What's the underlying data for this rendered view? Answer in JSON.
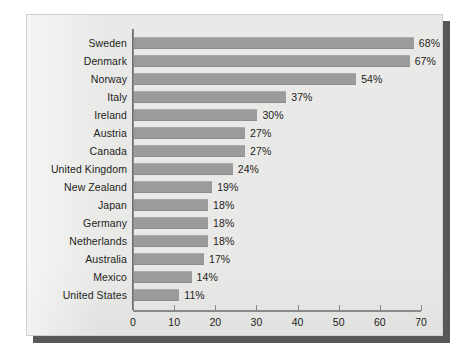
{
  "chart_data": {
    "type": "bar",
    "orientation": "horizontal",
    "title": "",
    "subtitle": "",
    "xlabel": "",
    "ylabel": "",
    "xlim": [
      0,
      70
    ],
    "grid": false,
    "legend": null,
    "xticks": [
      "0",
      "10",
      "20",
      "30",
      "40",
      "50",
      "60",
      "70"
    ],
    "xtick_values": [
      0,
      10,
      20,
      30,
      40,
      50,
      60,
      70
    ],
    "value_suffix": "%",
    "categories": [
      "Sweden",
      "Denmark",
      "Norway",
      "Italy",
      "Ireland",
      "Austria",
      "Canada",
      "United Kingdom",
      "New Zealand",
      "Japan",
      "Germany",
      "Netherlands",
      "Australia",
      "Mexico",
      "United States"
    ],
    "values": [
      68,
      67,
      54,
      37,
      30,
      27,
      27,
      24,
      19,
      18,
      18,
      18,
      17,
      14,
      11
    ],
    "value_labels": [
      "68%",
      "67%",
      "54%",
      "37%",
      "30%",
      "27%",
      "27%",
      "24%",
      "19%",
      "18%",
      "18%",
      "18%",
      "17%",
      "14%",
      "11%"
    ]
  },
  "colors": {
    "bar": "#9b9b99",
    "panel_background": "#e9e9e7",
    "axis": "#8a8a88",
    "text": "#1d1d1b",
    "shadow": "#56585a",
    "page_background": "#ffffff"
  }
}
